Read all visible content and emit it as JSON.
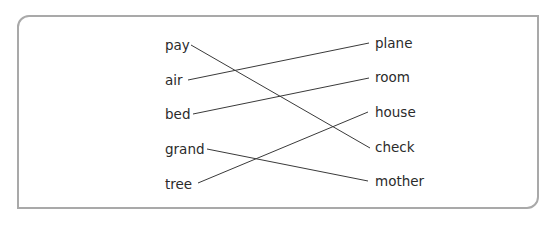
{
  "exercise": {
    "left_words": [
      {
        "text": "pay",
        "x": 165,
        "y": 37
      },
      {
        "text": "air",
        "x": 165,
        "y": 72
      },
      {
        "text": "bed",
        "x": 165,
        "y": 106
      },
      {
        "text": "grand",
        "x": 165,
        "y": 141
      },
      {
        "text": "tree",
        "x": 165,
        "y": 176
      }
    ],
    "right_words": [
      {
        "text": "plane",
        "x": 375,
        "y": 35
      },
      {
        "text": "room",
        "x": 375,
        "y": 69
      },
      {
        "text": "house",
        "x": 375,
        "y": 104
      },
      {
        "text": "check",
        "x": 375,
        "y": 139
      },
      {
        "text": "mother",
        "x": 375,
        "y": 173
      }
    ],
    "matches": [
      {
        "from": "pay",
        "to": "check",
        "x1": 191,
        "y1": 45,
        "x2": 370,
        "y2": 148
      },
      {
        "from": "air",
        "to": "plane",
        "x1": 188,
        "y1": 80,
        "x2": 369,
        "y2": 43
      },
      {
        "from": "bed",
        "to": "room",
        "x1": 193,
        "y1": 114,
        "x2": 369,
        "y2": 78
      },
      {
        "from": "grand",
        "to": "mother",
        "x1": 207,
        "y1": 149,
        "x2": 368,
        "y2": 181
      },
      {
        "from": "tree",
        "to": "house",
        "x1": 198,
        "y1": 183,
        "x2": 368,
        "y2": 112
      }
    ],
    "colors": {
      "frame": "#a9a9a9",
      "line": "#3a3a3a",
      "text": "#2b2b2b"
    }
  }
}
